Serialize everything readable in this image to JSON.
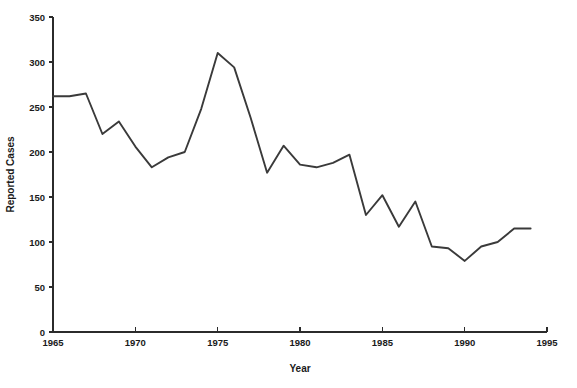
{
  "chart_data": {
    "type": "line",
    "title": "",
    "xlabel": "Year",
    "ylabel": "Reported Cases",
    "xlim": [
      1965,
      1995
    ],
    "ylim": [
      0,
      350
    ],
    "xticks": [
      1965,
      1970,
      1975,
      1980,
      1985,
      1990,
      1995
    ],
    "yticks": [
      0,
      50,
      100,
      150,
      200,
      250,
      300,
      350
    ],
    "xtick_labels": [
      "1965",
      "1970",
      "1975",
      "1980",
      "1985",
      "1990",
      "1995"
    ],
    "ytick_labels": [
      "0",
      "50",
      "100",
      "150",
      "200",
      "250",
      "300",
      "350"
    ],
    "grid": false,
    "legend": null,
    "line_color": "#3a3a3a",
    "x": [
      1965,
      1966,
      1967,
      1968,
      1969,
      1970,
      1971,
      1972,
      1973,
      1974,
      1975,
      1976,
      1977,
      1978,
      1979,
      1980,
      1981,
      1982,
      1983,
      1984,
      1985,
      1986,
      1987,
      1988,
      1989,
      1990,
      1991,
      1992,
      1993,
      1994
    ],
    "values": [
      262,
      262,
      265,
      220,
      234,
      206,
      183,
      194,
      200,
      248,
      310,
      294,
      238,
      177,
      207,
      186,
      183,
      188,
      197,
      130,
      152,
      117,
      145,
      95,
      93,
      79,
      95,
      100,
      115,
      115
    ],
    "series": [
      {
        "name": "Reported Cases",
        "values": [
          262,
          262,
          265,
          220,
          234,
          206,
          183,
          194,
          200,
          248,
          310,
          294,
          238,
          177,
          207,
          186,
          183,
          188,
          197,
          130,
          152,
          117,
          145,
          95,
          93,
          79,
          95,
          100,
          115,
          115
        ]
      }
    ]
  }
}
